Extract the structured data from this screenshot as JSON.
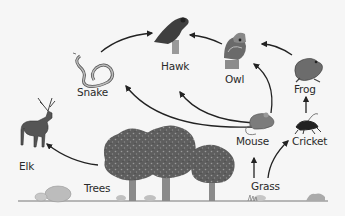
{
  "diagram": {
    "type": "food-web",
    "colors": {
      "background": "#f6f6f6",
      "arrow": "#222222",
      "label": "#2a2a2a",
      "ground": "#777777",
      "foliage": "#5e5e5e",
      "trunk": "#8a8a8a"
    },
    "organisms": [
      {
        "id": "hawk",
        "label": "Hawk",
        "icon": "hawk-icon",
        "role": "top predator"
      },
      {
        "id": "owl",
        "label": "Owl",
        "icon": "owl-icon",
        "role": "predator"
      },
      {
        "id": "snake",
        "label": "Snake",
        "icon": "snake-icon",
        "role": "predator"
      },
      {
        "id": "frog",
        "label": "Frog",
        "icon": "frog-icon",
        "role": "consumer"
      },
      {
        "id": "elk",
        "label": "Elk",
        "icon": "elk-icon",
        "role": "herbivore"
      },
      {
        "id": "mouse",
        "label": "Mouse",
        "icon": "mouse-icon",
        "role": "herbivore"
      },
      {
        "id": "cricket",
        "label": "Cricket",
        "icon": "cricket-icon",
        "role": "herbivore"
      },
      {
        "id": "trees",
        "label": "Trees",
        "icon": "trees-icon",
        "role": "producer"
      },
      {
        "id": "grass",
        "label": "Grass",
        "icon": "grass-icon",
        "role": "producer"
      }
    ],
    "arrows": [
      {
        "from": "snake",
        "to": "hawk"
      },
      {
        "from": "owl",
        "to": "hawk"
      },
      {
        "from": "frog",
        "to": "owl"
      },
      {
        "from": "mouse",
        "to": "snake"
      },
      {
        "from": "mouse",
        "to": "hawk"
      },
      {
        "from": "mouse",
        "to": "owl"
      },
      {
        "from": "cricket",
        "to": "frog"
      },
      {
        "from": "grass",
        "to": "mouse"
      },
      {
        "from": "grass",
        "to": "cricket"
      },
      {
        "from": "trees",
        "to": "elk"
      }
    ]
  },
  "labels": {
    "hawk": "Hawk",
    "owl": "Owl",
    "snake": "Snake",
    "frog": "Frog",
    "elk": "Elk",
    "mouse": "Mouse",
    "cricket": "Cricket",
    "trees": "Trees",
    "grass": "Grass"
  }
}
